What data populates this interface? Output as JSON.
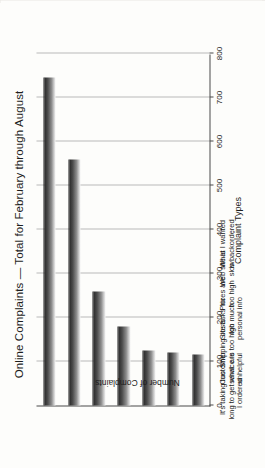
{
  "document": {
    "figure_title": "Online Complaints — Total for February through August"
  },
  "chart_data": {
    "type": "bar",
    "orientation": "vertical",
    "title": "Online Complaints — Total for February through August",
    "xlabel": "Complaint Types",
    "ylabel": "Number of Complaints",
    "ylim": [
      0,
      800
    ],
    "grid": true,
    "legend": "none",
    "categories": [
      "It's taking too long to get what I ordered",
      "Customer service is unhelpful",
      "Shipping costs are too high",
      "Site asks for too much personal info",
      "Prices are too high",
      "Web site is slow",
      "What I wanted is backordered"
    ],
    "category_lines": [
      [
        "It's taking too",
        "long to get what",
        "I ordered"
      ],
      [
        "Customer",
        "service is",
        "unhelpful"
      ],
      [
        "Shipping costs",
        "are too high"
      ],
      [
        "Site asks for",
        "too much",
        "personal info"
      ],
      [
        "Prices are",
        "too high"
      ],
      [
        "Web site is",
        "slow"
      ],
      [
        "What I wanted",
        "is backordered"
      ]
    ],
    "values": [
      745,
      560,
      260,
      180,
      125,
      120,
      115
    ],
    "yticks": [
      0,
      100,
      200,
      300,
      400,
      500,
      600,
      700,
      800
    ],
    "ytick_labels": [
      "0",
      "100",
      "200",
      "300",
      "400",
      "500",
      "600",
      "700",
      "800"
    ],
    "bar_color_top": "#2a2a2a",
    "bar_color_bottom": "#f2f2f2",
    "axis_color": "#4a4a4a",
    "gridline_color": "#b9b9b9"
  }
}
